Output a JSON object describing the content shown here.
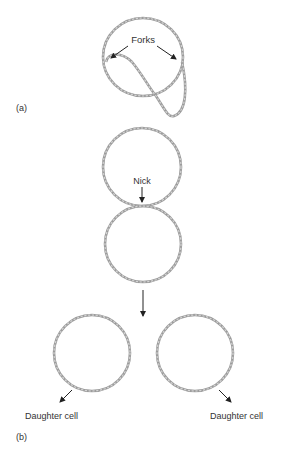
{
  "figure": {
    "panel_a": {
      "label": "(a)",
      "annotation": "Forks"
    },
    "panel_b": {
      "label": "(b)",
      "nick_label": "Nick",
      "left_daughter_label": "Daughter cell",
      "right_daughter_label": "Daughter cell"
    },
    "colors": {
      "strand": "#9c9c9c",
      "strand_highlight": "#d4d4d4",
      "text": "#333333",
      "arrow": "#222222"
    }
  }
}
